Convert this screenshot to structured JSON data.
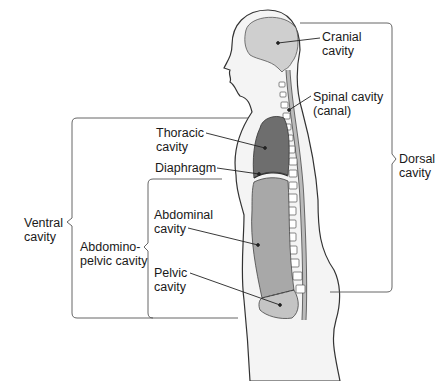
{
  "diagram": {
    "colors": {
      "body_fill": "#f4f4f4",
      "body_outline": "#333333",
      "cranial_fill": "#cfcfcf",
      "thoracic_fill": "#6e6e6e",
      "abdominal_fill": "#a8a8a8",
      "pelvic_fill": "#c4c4c4",
      "bracket": "#555555"
    },
    "labels": {
      "cranial": "Cranial\ncavity",
      "spinal": "Spinal cavity\n(canal)",
      "dorsal": "Dorsal\ncavity",
      "thoracic": "Thoracic\ncavity",
      "diaphragm": "Diaphragm",
      "ventral": "Ventral\ncavity",
      "abdominal": "Abdominal\ncavity",
      "abdominopelvic": "Abdomino-\npelvic cavity",
      "pelvic": "Pelvic\ncavity"
    }
  }
}
